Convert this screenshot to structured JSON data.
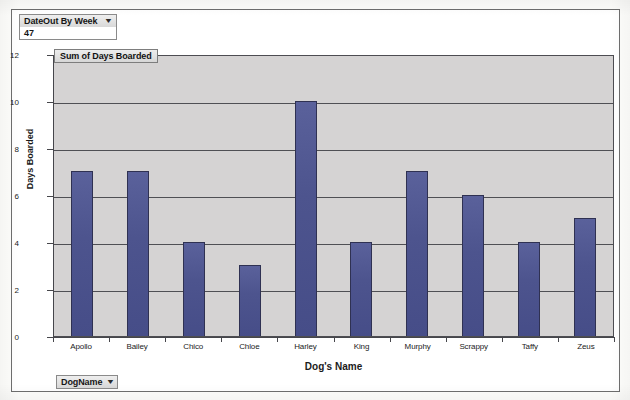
{
  "window": {
    "title": "Sum of Days Boarded"
  },
  "filters": {
    "page_field_label": "DateOut By Week",
    "page_field_value": "47",
    "page_field_caret": "chevron-down-icon",
    "axis_field_label": "DogName",
    "axis_field_caret": "chevron-down-icon"
  },
  "chart_data": {
    "type": "bar",
    "title": "Sum of Days Boarded",
    "xlabel": "Dog's Name",
    "ylabel": "Days Boarded",
    "categories": [
      "Apollo",
      "Bailey",
      "Chico",
      "Chloe",
      "Harley",
      "King",
      "Murphy",
      "Scrappy",
      "Taffy",
      "Zeus"
    ],
    "values": [
      7,
      7,
      4,
      3,
      10,
      4,
      7,
      6,
      4,
      5
    ],
    "series": [
      {
        "name": "Sum of Days Boarded",
        "values": [
          7,
          7,
          4,
          3,
          10,
          4,
          7,
          6,
          4,
          5
        ]
      }
    ],
    "ylim": [
      0,
      12
    ],
    "yticks": [
      0,
      2,
      4,
      6,
      8,
      10,
      12
    ],
    "ytick_labels": [
      "0",
      "2",
      "4",
      "6",
      "8",
      "10",
      "12"
    ],
    "grid": true,
    "grid_axis": "y",
    "legend": false,
    "bar_color": "#4d548e",
    "bar_border_color": "#2f3152",
    "plot_background": "#d5d3d3",
    "axis_color": "#46464b"
  }
}
